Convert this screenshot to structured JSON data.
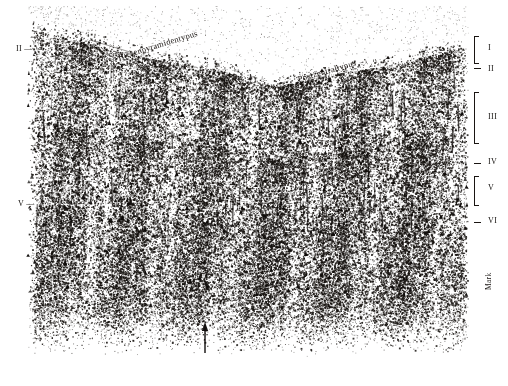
{
  "figure": {
    "kind": "histological-micrograph",
    "background_color": "#ffffff",
    "ink_color": "#15110e"
  },
  "annotations": {
    "region_labels": [
      {
        "id": "riesenpyramidentypus",
        "text": "Riesenpyramidentypus",
        "x": 118,
        "y": 52,
        "rotation": -17
      },
      {
        "id": "postzentraltypus",
        "text": "Postzentraltypus",
        "x": 298,
        "y": 74,
        "rotation": -16
      }
    ],
    "index_marks": [
      {
        "id": "index-1",
        "text": "i",
        "sub": "1",
        "x": 234,
        "y": 66
      }
    ],
    "white_matter_label": {
      "id": "mark",
      "text": "Mark",
      "x": 484,
      "y": 290,
      "rotation": -90
    }
  },
  "left_scale": {
    "items": [
      {
        "label": "II",
        "dash": "—",
        "x": 16,
        "y": 44
      },
      {
        "label": "V",
        "dash": "—",
        "x": 18,
        "y": 199
      }
    ]
  },
  "right_scale": {
    "title": "cortical layers",
    "items": [
      {
        "label": "I",
        "bracket": "brace",
        "bracket_top": 36,
        "bracket_height": 26,
        "label_y": 48
      },
      {
        "label": "II",
        "bracket": "dash",
        "bracket_top": 68,
        "bracket_height": 2,
        "label_y": 69
      },
      {
        "label": "III",
        "bracket": "brace",
        "bracket_top": 92,
        "bracket_height": 50,
        "label_y": 117
      },
      {
        "label": "IV",
        "bracket": "dash",
        "bracket_top": 163,
        "bracket_height": 2,
        "label_y": 162
      },
      {
        "label": "V",
        "bracket": "brace",
        "bracket_top": 176,
        "bracket_height": 28,
        "label_y": 188
      },
      {
        "label": "VI",
        "bracket": "dash",
        "bracket_top": 222,
        "bracket_height": 2,
        "label_y": 221
      }
    ]
  },
  "markers": {
    "arrow": {
      "id": "bottom-arrow",
      "direction": "up",
      "x": 205,
      "y": 325,
      "length": 28
    }
  }
}
